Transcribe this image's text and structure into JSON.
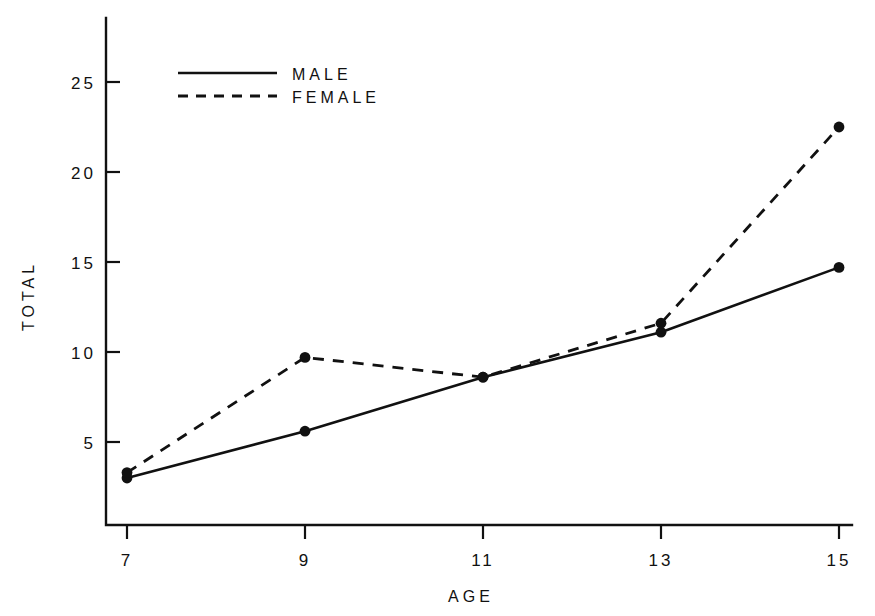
{
  "chart_data": {
    "type": "line",
    "title": "",
    "xlabel": "AGE",
    "ylabel": "TOTAL",
    "x": [
      7,
      9,
      11,
      13,
      15
    ],
    "xticklabels": [
      "7",
      "9",
      "11",
      "13",
      "15"
    ],
    "yticks": [
      5,
      10,
      15,
      20,
      25
    ],
    "yticklabels": [
      "5",
      "10",
      "15",
      "20",
      "25"
    ],
    "xlim": [
      7,
      15
    ],
    "ylim": [
      0,
      27
    ],
    "grid": false,
    "legend_position": "upper-left",
    "markers": "filled-circle",
    "series": [
      {
        "name": "MALE",
        "linestyle": "solid",
        "color": "#111111",
        "values": [
          3.0,
          5.6,
          8.6,
          11.1,
          14.7
        ]
      },
      {
        "name": "FEMALE",
        "linestyle": "dashed",
        "color": "#111111",
        "values": [
          3.3,
          9.7,
          8.6,
          11.6,
          22.5
        ]
      }
    ]
  },
  "legend": {
    "entries": [
      {
        "label": "MALE",
        "style": "solid"
      },
      {
        "label": "FEMALE",
        "style": "dashed"
      }
    ]
  },
  "axes": {
    "x_title": "AGE",
    "y_title": "TOTAL",
    "x_tick_labels": [
      "7",
      "9",
      "11",
      "13",
      "15"
    ],
    "y_tick_labels": [
      "5",
      "10",
      "15",
      "20",
      "25"
    ]
  }
}
